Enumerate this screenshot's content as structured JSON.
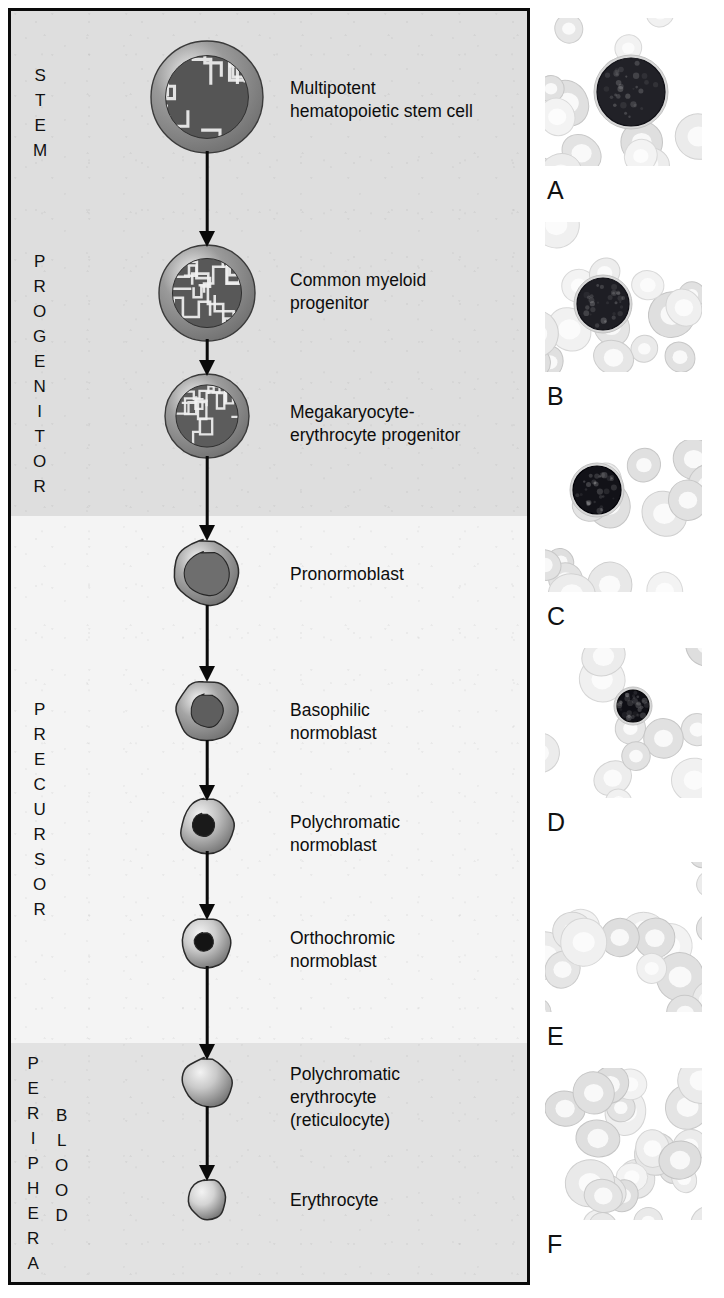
{
  "figure": {
    "background_color": "#ffffff",
    "panel_border_color": "#0a0a0a"
  },
  "zones": [
    {
      "id": "stem",
      "label": "STEM",
      "letters": [
        "S",
        "T",
        "E",
        "M"
      ],
      "band_color": "#dedede"
    },
    {
      "id": "progenitor",
      "label": "PROGENITOR",
      "letters": [
        "P",
        "R",
        "O",
        "G",
        "E",
        "N",
        "I",
        "T",
        "O",
        "R"
      ],
      "band_color": "#dedede"
    },
    {
      "id": "precursor",
      "label": "PRECURSOR",
      "letters": [
        "P",
        "R",
        "E",
        "C",
        "U",
        "R",
        "S",
        "O",
        "R"
      ],
      "band_color": "#f4f4f4"
    },
    {
      "id": "peripheral",
      "label": "PERIPHERAL",
      "letters": [
        "P",
        "E",
        "R",
        "I",
        "P",
        "H",
        "E",
        "R",
        "A",
        "L"
      ],
      "band_color": "#e2e2e2"
    },
    {
      "id": "blood",
      "label": "BLOOD",
      "letters": [
        "B",
        "L",
        "O",
        "O",
        "D"
      ],
      "band_color": "#e2e2e2"
    }
  ],
  "stages": [
    {
      "id": "multipotent-hematopoietic-stem-cell",
      "label": "Multipotent\nhematopoietic stem cell",
      "zone": "stem",
      "cell_type": "nucleated-large",
      "diameter": 112,
      "nucleus_ratio": 0.74,
      "cytoplasm_color": "#9a9a9a",
      "nucleus_color": "#555555",
      "has_chromatin_pattern": true
    },
    {
      "id": "common-myeloid-progenitor",
      "label": "Common myeloid\nprogenitor",
      "zone": "progenitor",
      "cell_type": "nucleated-large",
      "diameter": 96,
      "nucleus_ratio": 0.72,
      "cytoplasm_color": "#9a9a9a",
      "nucleus_color": "#585858",
      "has_chromatin_pattern": true
    },
    {
      "id": "megakaryocyte-erythrocyte-progenitor",
      "label": "Megakaryocyte-\nerythrocyte progenitor",
      "zone": "progenitor",
      "cell_type": "nucleated-large",
      "diameter": 84,
      "nucleus_ratio": 0.74,
      "cytoplasm_color": "#9d9d9d",
      "nucleus_color": "#5c5c5c",
      "has_chromatin_pattern": true
    },
    {
      "id": "pronormoblast",
      "label": "Pronormoblast",
      "zone": "precursor",
      "cell_type": "blob",
      "diameter": 68,
      "nucleus_ratio": 0.7,
      "cytoplasm_color": "#a8a8a8",
      "nucleus_color": "#6e6e6e",
      "has_chromatin_pattern": false
    },
    {
      "id": "basophilic-normoblast",
      "label": "Basophilic\nnormoblast",
      "zone": "precursor",
      "cell_type": "blob",
      "diameter": 62,
      "nucleus_ratio": 0.56,
      "cytoplasm_color": "#a5a5a5",
      "nucleus_color": "#5e5e5e",
      "has_chromatin_pattern": false
    },
    {
      "id": "polychromatic-normoblast",
      "label": "Polychromatic\nnormoblast",
      "zone": "precursor",
      "cell_type": "blob",
      "diameter": 54,
      "nucleus_ratio": 0.44,
      "cytoplasm_color": "#c2c2c2",
      "nucleus_color": "#1a1a1a",
      "has_chromatin_pattern": false
    },
    {
      "id": "orthochromic-normoblast",
      "label": "Orthochromic\nnormoblast",
      "zone": "precursor",
      "cell_type": "blob",
      "diameter": 50,
      "nucleus_ratio": 0.4,
      "cytoplasm_color": "#cccccc",
      "nucleus_color": "#141414",
      "has_chromatin_pattern": false
    },
    {
      "id": "polychromatic-erythrocyte",
      "label": "Polychromatic\nerythrocyte\n(reticulocyte)",
      "zone": "peripheral",
      "cell_type": "anucleate",
      "diameter": 50,
      "nucleus_ratio": 0,
      "cytoplasm_color": "#c9c9c9",
      "nucleus_color": "",
      "has_chromatin_pattern": false
    },
    {
      "id": "erythrocyte",
      "label": "Erythrocyte",
      "zone": "blood",
      "cell_type": "anucleate",
      "diameter": 40,
      "nucleus_ratio": 0,
      "cytoplasm_color": "#d4d4d4",
      "nucleus_color": "",
      "has_chromatin_pattern": false
    }
  ],
  "micrographs": [
    {
      "id": "panel-a",
      "letter": "A",
      "cell_darkness": 0.78,
      "cell_radius": 34,
      "cell_cx": 86,
      "cell_cy": 74,
      "background_cells": 14,
      "field_tint": "#e8e8e8"
    },
    {
      "id": "panel-b",
      "letter": "B",
      "cell_darkness": 0.8,
      "cell_radius": 26,
      "cell_cx": 58,
      "cell_cy": 82,
      "background_cells": 15,
      "field_tint": "#ececec"
    },
    {
      "id": "panel-c",
      "letter": "C",
      "cell_darkness": 0.88,
      "cell_radius": 24,
      "cell_cx": 52,
      "cell_cy": 50,
      "background_cells": 16,
      "field_tint": "#f0f0f0"
    },
    {
      "id": "panel-d",
      "letter": "D",
      "cell_darkness": 0.9,
      "cell_radius": 16,
      "cell_cx": 88,
      "cell_cy": 58,
      "background_cells": 11,
      "field_tint": "#f4f4f4"
    },
    {
      "id": "panel-e",
      "letter": "E",
      "cell_darkness": 0.2,
      "cell_radius": 0,
      "cell_cx": 0,
      "cell_cy": 0,
      "background_cells": 17,
      "field_tint": "#f6f6f6"
    },
    {
      "id": "panel-f",
      "letter": "F",
      "cell_darkness": 0.1,
      "cell_radius": 0,
      "cell_cx": 0,
      "cell_cy": 0,
      "background_cells": 26,
      "field_tint": "#fafafa"
    }
  ]
}
